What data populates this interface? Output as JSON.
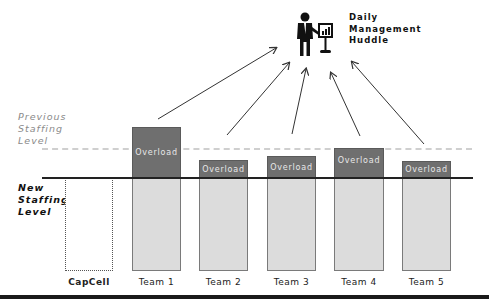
{
  "header": {
    "huddle_title_lines": [
      "Daily",
      "Management",
      "Huddle"
    ],
    "icon": "presenter-with-chart-board-icon"
  },
  "levels": {
    "previous_label_lines": [
      "Previous",
      "Staffing",
      "Level"
    ],
    "new_label_lines": [
      "New",
      "Staffing",
      "Level"
    ]
  },
  "bars": [
    {
      "label": "CapCell",
      "overload": null,
      "style": "dotted-empty"
    },
    {
      "label": "Team 1",
      "overload": "Overload"
    },
    {
      "label": "Team 2",
      "overload": "Overload"
    },
    {
      "label": "Team 3",
      "overload": "Overload"
    },
    {
      "label": "Team 4",
      "overload": "Overload"
    },
    {
      "label": "Team 5",
      "overload": "Overload"
    }
  ],
  "colors": {
    "overload_fill": "#6f6f6f",
    "base_fill": "#dcdcdc",
    "previous_line": "#cfcfcf",
    "baseline": "#222222"
  }
}
